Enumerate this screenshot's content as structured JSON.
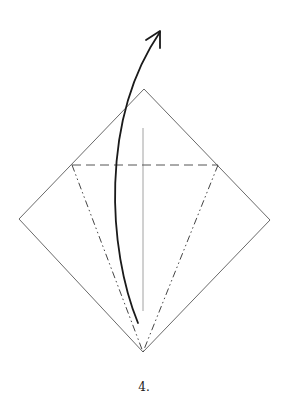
{
  "diagram": {
    "type": "origami-fold-step",
    "step_label": "4.",
    "colors": {
      "paper_edge": "#6a6a6a",
      "valley_fold": "#555555",
      "mountain_fold": "#444444",
      "center_crease": "#8a8a8a",
      "arrow": "#1a1a1a"
    },
    "square": {
      "top": [
        144,
        89
      ],
      "right": [
        270,
        220
      ],
      "bottom": [
        143,
        352
      ],
      "left": [
        19,
        219
      ]
    },
    "valley_fold_line": {
      "from": [
        72,
        165
      ],
      "to": [
        218,
        165
      ],
      "style": "dashed"
    },
    "mountain_fold_lines": [
      {
        "from": [
          72,
          165
        ],
        "to": [
          143,
          352
        ],
        "style": "dash-dot-dot"
      },
      {
        "from": [
          218,
          165
        ],
        "to": [
          143,
          352
        ],
        "style": "dash-dot-dot"
      }
    ],
    "center_crease": {
      "from": [
        143,
        128
      ],
      "to": [
        143,
        311
      ]
    },
    "fold_arrow": {
      "start": [
        138,
        323
      ],
      "control": [
        100,
        130
      ],
      "end": [
        160,
        32
      ],
      "direction": "up"
    }
  }
}
